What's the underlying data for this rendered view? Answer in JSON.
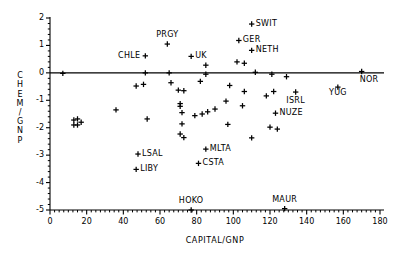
{
  "chart_data": {
    "type": "scatter",
    "title": "",
    "xlabel": "CAPITAL/GNP",
    "ylabel": "CHEM/GNP",
    "xlim": [
      0,
      180
    ],
    "ylim": [
      -5,
      2
    ],
    "xticks": [
      0,
      20,
      40,
      60,
      80,
      100,
      120,
      140,
      160,
      180
    ],
    "yticks": [
      2,
      1,
      0,
      -1,
      -2,
      -3,
      -4,
      -5
    ],
    "xtick_labels": [
      "0",
      "20",
      "40",
      "60",
      "80",
      "100",
      "120",
      "140",
      "160",
      "180"
    ],
    "ytick_labels": [
      "2",
      "1",
      "0",
      "-1",
      "-2",
      "-3",
      "-4",
      "-5"
    ],
    "grid": false,
    "legend": null,
    "minor_ticks": true,
    "zero_line": true,
    "marker": "plus",
    "points": [
      {
        "label": "SWIT",
        "x": 110,
        "y": 1.78,
        "label_pos": "right"
      },
      {
        "label": "GER",
        "x": 103,
        "y": 1.18,
        "label_pos": "right"
      },
      {
        "label": "NETH",
        "x": 110,
        "y": 0.82,
        "label_pos": "right"
      },
      {
        "label": "PRGY",
        "x": 64,
        "y": 1.05,
        "label_pos": "above"
      },
      {
        "label": "UK",
        "x": 77,
        "y": 0.6,
        "label_pos": "right"
      },
      {
        "label": "CHLE",
        "x": 52,
        "y": 0.62,
        "label_pos": "left"
      },
      {
        "label": "NOR",
        "x": 170,
        "y": 0.05,
        "label_pos": "below-right"
      },
      {
        "label": "YUG",
        "x": 157,
        "y": -0.52,
        "label_pos": "below-left"
      },
      {
        "label": "ISRL",
        "x": 134,
        "y": -0.7,
        "label_pos": "below"
      },
      {
        "label": "NUZE",
        "x": 123,
        "y": -1.47,
        "label_pos": "right"
      },
      {
        "label": "MLTA",
        "x": 85,
        "y": -2.78,
        "label_pos": "right"
      },
      {
        "label": "CSTA",
        "x": 81,
        "y": -3.3,
        "label_pos": "right"
      },
      {
        "label": "LSAL",
        "x": 48,
        "y": -2.96,
        "label_pos": "right"
      },
      {
        "label": "LIBY",
        "x": 47,
        "y": -3.52,
        "label_pos": "right"
      },
      {
        "label": "HOKO",
        "x": 77,
        "y": -5.0,
        "label_pos": "above"
      },
      {
        "label": "MAUR",
        "x": 128,
        "y": -4.95,
        "label_pos": "above"
      },
      {
        "label": "",
        "x": 7,
        "y": -0.02
      },
      {
        "label": "",
        "x": 13,
        "y": -1.72
      },
      {
        "label": "",
        "x": 15,
        "y": -1.68
      },
      {
        "label": "",
        "x": 13,
        "y": -1.9
      },
      {
        "label": "",
        "x": 15,
        "y": -1.9
      },
      {
        "label": "",
        "x": 17,
        "y": -1.8
      },
      {
        "label": "",
        "x": 36,
        "y": -1.35
      },
      {
        "label": "",
        "x": 47,
        "y": -0.48
      },
      {
        "label": "",
        "x": 51,
        "y": -0.42
      },
      {
        "label": "",
        "x": 52,
        "y": 0.0
      },
      {
        "label": "",
        "x": 53,
        "y": -1.68
      },
      {
        "label": "",
        "x": 65,
        "y": 0.0
      },
      {
        "label": "",
        "x": 66,
        "y": -0.36
      },
      {
        "label": "",
        "x": 70,
        "y": -0.63
      },
      {
        "label": "",
        "x": 73,
        "y": -0.65
      },
      {
        "label": "",
        "x": 71,
        "y": -1.12
      },
      {
        "label": "",
        "x": 71,
        "y": -1.22
      },
      {
        "label": "",
        "x": 72,
        "y": -1.45
      },
      {
        "label": "",
        "x": 72,
        "y": -1.86
      },
      {
        "label": "",
        "x": 71,
        "y": -2.23
      },
      {
        "label": "",
        "x": 73,
        "y": -2.36
      },
      {
        "label": "",
        "x": 79,
        "y": -1.56
      },
      {
        "label": "",
        "x": 82,
        "y": -0.31
      },
      {
        "label": "",
        "x": 83,
        "y": -1.5
      },
      {
        "label": "",
        "x": 85,
        "y": 0.28
      },
      {
        "label": "",
        "x": 85,
        "y": -0.05
      },
      {
        "label": "",
        "x": 86,
        "y": -1.42
      },
      {
        "label": "",
        "x": 90,
        "y": -1.32
      },
      {
        "label": "",
        "x": 96,
        "y": -1.03
      },
      {
        "label": "",
        "x": 98,
        "y": -0.46
      },
      {
        "label": "",
        "x": 97,
        "y": -1.88
      },
      {
        "label": "",
        "x": 102,
        "y": 0.4
      },
      {
        "label": "",
        "x": 106,
        "y": 0.35
      },
      {
        "label": "",
        "x": 105,
        "y": -1.2
      },
      {
        "label": "",
        "x": 106,
        "y": -0.68
      },
      {
        "label": "",
        "x": 112,
        "y": 0.02
      },
      {
        "label": "",
        "x": 110,
        "y": -2.37
      },
      {
        "label": "",
        "x": 118,
        "y": -0.84
      },
      {
        "label": "",
        "x": 121,
        "y": -0.05
      },
      {
        "label": "",
        "x": 120,
        "y": -1.98
      },
      {
        "label": "",
        "x": 124,
        "y": -2.05
      },
      {
        "label": "",
        "x": 122,
        "y": -0.68
      },
      {
        "label": "",
        "x": 129,
        "y": -0.14
      }
    ]
  }
}
